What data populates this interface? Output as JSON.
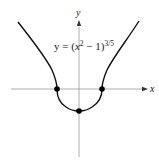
{
  "figure": {
    "equation": {
      "prefix": "y = (",
      "var": "x",
      "sup1": "2",
      "middle": " − 1)",
      "sup2": "3/5"
    },
    "axes": {
      "x_label": "x",
      "y_label": "y"
    },
    "colors": {
      "curve": "#111111",
      "axis": "#999999",
      "point": "#000000"
    },
    "points": [
      {
        "name": "x-intercept-left",
        "coord": "(-1, 0)"
      },
      {
        "name": "x-intercept-right",
        "coord": "(1, 0)"
      },
      {
        "name": "y-intercept",
        "coord": "(0, -1)"
      }
    ]
  }
}
